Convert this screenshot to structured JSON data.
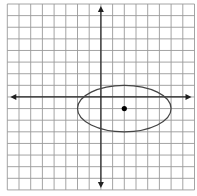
{
  "chart_data": {
    "type": "scatter",
    "title": "",
    "xlabel": "",
    "ylabel": "",
    "xlim": [
      -8,
      8
    ],
    "ylim": [
      -8,
      8
    ],
    "grid": true,
    "grid_step": 1,
    "axes_arrows": true,
    "tick_labels": false,
    "shapes": [
      {
        "type": "ellipse",
        "center": [
          2,
          -1
        ],
        "semi_axis_x": 4,
        "semi_axis_y": 2,
        "equation": "(x-2)^2/16 + (y+1)^2/4 = 1"
      }
    ],
    "points": [
      {
        "label": "center",
        "x": 2,
        "y": -1
      }
    ]
  },
  "style": {
    "grid_color": "#9a9a9a",
    "axis_color": "#222222",
    "ellipse_color": "#444444",
    "point_color": "#000000",
    "background": "#ffffff"
  },
  "layout": {
    "grid_left_px": 7.3,
    "grid_top_px": 4,
    "cell_px_x": 11.7,
    "cell_px_y": 11.62,
    "cells": 16
  }
}
